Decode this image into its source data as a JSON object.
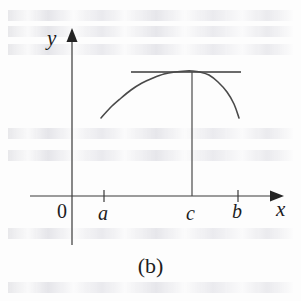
{
  "figure": {
    "caption": "(b)",
    "background_color": "#fdfdfd",
    "ink_color": "#2b2b2b",
    "axis_color": "#3a3a3a"
  },
  "axes": {
    "y_axis_label": "y",
    "x_axis_label": "x",
    "origin_label": "0"
  },
  "ticks": [
    {
      "label": "a",
      "x": 104
    },
    {
      "label": "c",
      "x": 192
    },
    {
      "label": "b",
      "x": 238
    }
  ],
  "chart_data": {
    "type": "line",
    "title": "(b)",
    "xlabel": "x",
    "ylabel": "y",
    "grid": false,
    "legend": null,
    "xlim": [
      0,
      1
    ],
    "ylim": [
      0,
      1
    ],
    "x_tick_labels": [
      "0",
      "a",
      "c",
      "b"
    ],
    "y_tick_labels": [],
    "annotations": [
      {
        "name": "horizontal-tangent-line",
        "type": "segment",
        "note": "horizontal tangent touching the curve at its maximum x = c",
        "x_start_px": 131,
        "x_end_px": 241,
        "y_px": 72
      },
      {
        "name": "vertical-drop-line-at-c",
        "type": "segment",
        "note": "vertical line from the maximum point down to the x-axis at x = c",
        "x_px": 192,
        "y_start_px": 72,
        "y_end_px": 196
      }
    ],
    "series": [
      {
        "name": "f",
        "note": "concave-down curve with interior maximum at x = c",
        "points_px": [
          [
            101,
            118
          ],
          [
            110,
            108
          ],
          [
            120,
            99
          ],
          [
            131,
            90
          ],
          [
            142,
            83
          ],
          [
            153,
            78
          ],
          [
            164,
            74
          ],
          [
            175,
            72
          ],
          [
            186,
            71
          ],
          [
            192,
            71
          ],
          [
            200,
            72
          ],
          [
            209,
            75
          ],
          [
            218,
            82
          ],
          [
            227,
            92
          ],
          [
            234,
            104
          ],
          [
            239,
            118
          ]
        ]
      }
    ]
  },
  "geometry": {
    "x_axis": {
      "x_start": 30,
      "x_end": 282,
      "y": 196
    },
    "y_axis": {
      "x": 72,
      "y_top": 30,
      "y_bottom": 245
    },
    "tick_half_height": 6
  }
}
